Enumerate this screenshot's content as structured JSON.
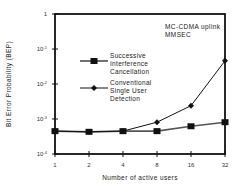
{
  "chart_data": {
    "type": "line",
    "title": "",
    "annotation": [
      "MC-CDMA uplink",
      "MMSEC"
    ],
    "xlabel": "Number of active users",
    "ylabel": "Bit Error Probability (BEP)",
    "x": [
      1,
      2,
      4,
      8,
      16,
      32
    ],
    "x_tick_labels": [
      "1",
      "2",
      "4",
      "8",
      "16",
      "32"
    ],
    "x_scale": "log2",
    "y_scale": "log",
    "ylim": [
      0.0001,
      1
    ],
    "y_tick_labels": [
      "1",
      "10-1",
      "10-2",
      "10-3",
      "10-4"
    ],
    "grid": false,
    "legend_position": "inside-left",
    "series": [
      {
        "name": "Successive Interference Cancellation",
        "marker": "square",
        "values": [
          0.00045,
          0.00043,
          0.00045,
          0.00045,
          0.00062,
          0.00081
        ]
      },
      {
        "name": "Conventional Single User Detection",
        "marker": "diamond",
        "values": [
          0.00045,
          0.00043,
          0.00045,
          0.00081,
          0.0024,
          0.046
        ]
      }
    ]
  },
  "labels": {
    "xlabel": "Number of active users",
    "ylabel": "Bit Error Probability (BEP)",
    "annotation_line1": "MC-CDMA uplink",
    "annotation_line2": "MMSEC",
    "legend_sic": "Successive\nInterference\nCancellation",
    "legend_conv": "Conventional\nSingle User\nDetection"
  }
}
